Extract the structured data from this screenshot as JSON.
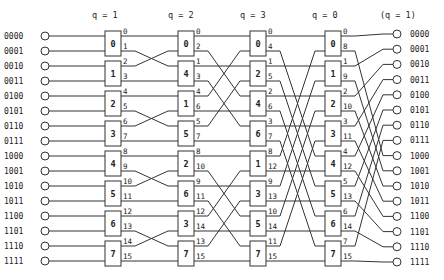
{
  "stage_headers": [
    "q = 1",
    "q = 2",
    "q = 3",
    "q = 0",
    "(q = 1)"
  ],
  "input_labels": [
    "0000",
    "0001",
    "0010",
    "0011",
    "0100",
    "0101",
    "0110",
    "0111",
    "1000",
    "1001",
    "1010",
    "1011",
    "1100",
    "1101",
    "1110",
    "1111"
  ],
  "output_labels": [
    "0000",
    "0001",
    "0010",
    "0011",
    "0100",
    "0101",
    "0110",
    "0111",
    "1000",
    "1001",
    "1010",
    "1011",
    "1100",
    "1101",
    "1110",
    "1111"
  ],
  "stages": [
    {
      "boxes": [
        0,
        1,
        2,
        3,
        4,
        5,
        6,
        7
      ],
      "row_labels": [
        0,
        1,
        2,
        3,
        4,
        5,
        6,
        7,
        8,
        9,
        10,
        11,
        12,
        13,
        14,
        15
      ]
    },
    {
      "boxes": [
        0,
        4,
        1,
        5,
        2,
        6,
        3,
        7
      ],
      "row_labels": [
        0,
        2,
        1,
        3,
        4,
        6,
        5,
        7,
        8,
        10,
        9,
        11,
        12,
        14,
        13,
        15
      ]
    },
    {
      "boxes": [
        0,
        2,
        4,
        6,
        1,
        3,
        5,
        7
      ],
      "row_labels": [
        0,
        4,
        1,
        5,
        2,
        6,
        3,
        7,
        8,
        12,
        9,
        13,
        10,
        14,
        11,
        15
      ]
    },
    {
      "boxes": [
        0,
        1,
        2,
        3,
        4,
        5,
        6,
        7
      ],
      "row_labels": [
        0,
        8,
        1,
        9,
        2,
        10,
        3,
        11,
        4,
        12,
        5,
        13,
        6,
        14,
        7,
        15
      ]
    }
  ],
  "colors": {
    "ink": "#333333",
    "background": "#ffffff"
  }
}
